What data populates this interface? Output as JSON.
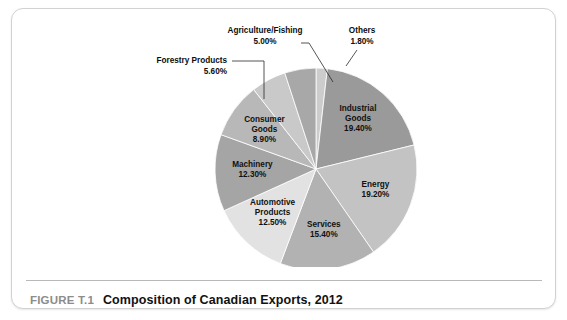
{
  "figure": {
    "number": "FIGURE T.1",
    "title": "Composition of Canadian Exports, 2012"
  },
  "chart_data": {
    "type": "pie",
    "title": "Composition of Canadian Exports, 2012",
    "unit": "percent",
    "start_angle_deg": 0,
    "direction": "clockwise",
    "legend": "none (labels on slices and callouts)",
    "categories": [
      "Others",
      "Industrial Goods",
      "Energy",
      "Services",
      "Automotive Products",
      "Machinery",
      "Consumer Goods",
      "Forestry Products",
      "Agriculture/Fishing"
    ],
    "values": [
      1.8,
      19.4,
      19.2,
      15.4,
      12.5,
      12.3,
      8.9,
      5.6,
      5.0
    ],
    "labels": [
      "1.80%",
      "19.40%",
      "19.20%",
      "15.40%",
      "12.50%",
      "12.30%",
      "8.90%",
      "5.60%",
      "5.00%"
    ],
    "colors": [
      "#cccccc",
      "#9a9a9a",
      "#c3c3c3",
      "#b2b2b2",
      "#e2e2e2",
      "#a5a5a5",
      "#b8b8b8",
      "#c9c9c9",
      "#a8a8a8"
    ],
    "slices": [
      {
        "name": "Others",
        "value": 1.8,
        "label": "Others",
        "value_label": "1.80%",
        "color": "#cccccc",
        "label_placement": "callout"
      },
      {
        "name": "Industrial Goods",
        "value": 19.4,
        "label": "Industrial Goods",
        "value_label": "19.40%",
        "color": "#9a9a9a",
        "label_placement": "inside"
      },
      {
        "name": "Energy",
        "value": 19.2,
        "label": "Energy",
        "value_label": "19.20%",
        "color": "#c3c3c3",
        "label_placement": "inside"
      },
      {
        "name": "Services",
        "value": 15.4,
        "label": "Services",
        "value_label": "15.40%",
        "color": "#b2b2b2",
        "label_placement": "inside"
      },
      {
        "name": "Automotive Products",
        "value": 12.5,
        "label": "Automotive Products",
        "value_label": "12.50%",
        "color": "#e2e2e2",
        "label_placement": "inside"
      },
      {
        "name": "Machinery",
        "value": 12.3,
        "label": "Machinery",
        "value_label": "12.30%",
        "color": "#a5a5a5",
        "label_placement": "inside"
      },
      {
        "name": "Consumer Goods",
        "value": 8.9,
        "label": "Consumer Goods",
        "value_label": "8.90%",
        "color": "#b8b8b8",
        "label_placement": "inside"
      },
      {
        "name": "Forestry Products",
        "value": 5.6,
        "label": "Forestry Products",
        "value_label": "5.60%",
        "color": "#c9c9c9",
        "label_placement": "callout"
      },
      {
        "name": "Agriculture/Fishing",
        "value": 5.0,
        "label": "Agriculture/Fishing",
        "value_label": "5.00%",
        "color": "#a8a8a8",
        "label_placement": "callout"
      }
    ],
    "callouts": [
      {
        "name": "agriculture-fishing",
        "lines": [
          "Agriculture/Fishing",
          "5.00%"
        ],
        "text_x": 253,
        "text_y": 24,
        "text_anchor": "middle",
        "leader": "M 289 34 L 297 34 L 321 73"
      },
      {
        "name": "others",
        "lines": [
          "Others",
          "1.80%"
        ],
        "text_x": 350,
        "text_y": 24,
        "text_anchor": "middle",
        "leader": "M 345 41 L 334 57"
      },
      {
        "name": "forestry-products",
        "lines": [
          "Forestry Products",
          "5.60%"
        ],
        "text_x": 215,
        "text_y": 54,
        "text_anchor": "end",
        "leader": "M 220 52 L 252 52 L 252 90"
      }
    ],
    "pie_geometry": {
      "center_x": 304,
      "center_y": 160,
      "radius": 101
    }
  }
}
